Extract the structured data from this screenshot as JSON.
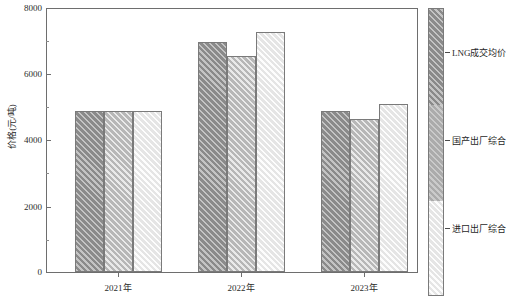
{
  "chart_data": {
    "type": "bar",
    "title": "",
    "xlabel": "",
    "ylabel": "价格(元/吨)",
    "ylim": [
      0,
      8000
    ],
    "yticks": [
      0,
      2000,
      4000,
      6000,
      8000
    ],
    "ytick_labels": [
      "0",
      "2000",
      "4000",
      "6000",
      "8000"
    ],
    "minor_yticks": [
      1000,
      3000,
      5000,
      7000
    ],
    "grid": false,
    "legend_position": "right-colorbar",
    "categories": [
      "2021年",
      "2022年",
      "2023年"
    ],
    "series": [
      {
        "name": "LNG成交均价",
        "values": [
          4900,
          7000,
          4900
        ]
      },
      {
        "name": "国产出厂综合",
        "values": [
          4900,
          6560,
          4650
        ]
      },
      {
        "name": "进口出厂综合",
        "values": [
          4900,
          7300,
          5120
        ]
      }
    ]
  },
  "axis": {
    "y_label": "价格(元/吨)",
    "y_tick_labels": [
      "8000",
      "6000",
      "4000",
      "2000",
      "0"
    ],
    "x_tick_labels": [
      "2021年",
      "2022年",
      "2023年"
    ]
  },
  "legend": {
    "items": [
      {
        "label": "LNG成交均价",
        "swatch": "#9a9a9a"
      },
      {
        "label": "国产出厂综合",
        "swatch": "#b4b4b4"
      },
      {
        "label": "进口出厂综合",
        "swatch": "#efefef"
      }
    ]
  },
  "colors": {
    "series_1": "#9a9a9a",
    "series_2": "#c9c9c9",
    "series_3": "#f2f2f2",
    "frame": "#6e6e6e",
    "text": "#2b2b2b",
    "background": "#ffffff"
  }
}
